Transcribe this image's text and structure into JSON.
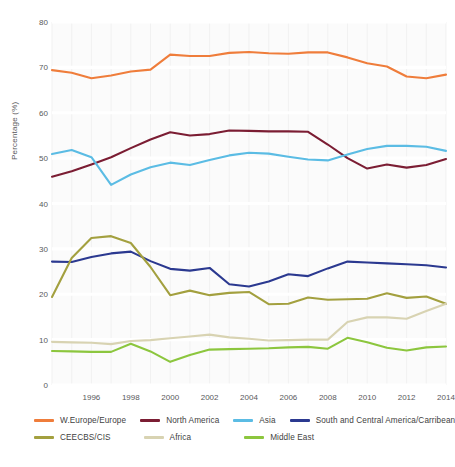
{
  "chart_data": {
    "type": "line",
    "title": "",
    "xlabel": "",
    "ylabel": "Percentage (%)",
    "ylim": [
      0,
      80
    ],
    "ytick_values": [
      0,
      10,
      20,
      30,
      40,
      50,
      60,
      70,
      80
    ],
    "xlim": [
      1994,
      2014
    ],
    "xtick_values": [
      1996,
      1998,
      2000,
      2002,
      2004,
      2006,
      2008,
      2010,
      2012,
      2014
    ],
    "x": [
      1994,
      1995,
      1996,
      1997,
      1998,
      1999,
      2000,
      2001,
      2002,
      2003,
      2004,
      2005,
      2006,
      2007,
      2008,
      2009,
      2010,
      2011,
      2012,
      2013,
      2014
    ],
    "grid": true,
    "legend_position": "bottom",
    "series": [
      {
        "name": "W.Europe/Europe",
        "color": "#ef7d3b",
        "values": [
          69.4,
          68.8,
          67.6,
          68.2,
          69.1,
          69.5,
          72.8,
          72.5,
          72.5,
          73.2,
          73.4,
          73.1,
          73.0,
          73.3,
          73.3,
          72.2,
          70.9,
          70.2,
          68.0,
          67.6,
          68.4
        ]
      },
      {
        "name": "North America",
        "color": "#7b1d33",
        "values": [
          45.9,
          47.1,
          48.6,
          50.2,
          52.2,
          54.1,
          55.7,
          55.0,
          55.3,
          56.1,
          56.0,
          55.9,
          55.9,
          55.8,
          53.0,
          50.0,
          47.7,
          48.6,
          47.9,
          48.5,
          49.8
        ]
      },
      {
        "name": "Asia",
        "color": "#5bbce4",
        "values": [
          50.9,
          51.8,
          50.2,
          44.1,
          46.4,
          48.0,
          49.0,
          48.5,
          49.6,
          50.6,
          51.2,
          51.0,
          50.3,
          49.7,
          49.5,
          50.8,
          52.0,
          52.7,
          52.7,
          52.5,
          51.6
        ]
      },
      {
        "name": "South and Central America/Carribean",
        "color": "#2b3990",
        "values": [
          27.2,
          27.1,
          28.2,
          29.0,
          29.4,
          27.3,
          25.6,
          25.2,
          25.8,
          22.2,
          21.7,
          22.8,
          24.4,
          24.0,
          25.7,
          27.2,
          27.0,
          26.8,
          26.6,
          26.4,
          25.9
        ]
      },
      {
        "name": "CEECBS/CIS",
        "color": "#a3a03f",
        "values": [
          19.4,
          28.0,
          32.4,
          32.8,
          31.3,
          26.0,
          19.8,
          20.8,
          19.8,
          20.3,
          20.5,
          17.8,
          17.9,
          19.3,
          18.8,
          18.9,
          19.0,
          20.2,
          19.2,
          19.5,
          17.9
        ]
      },
      {
        "name": "Africa",
        "color": "#d8d3b2",
        "values": [
          9.5,
          9.4,
          9.3,
          9.0,
          9.7,
          9.9,
          10.3,
          10.7,
          11.1,
          10.5,
          10.2,
          9.8,
          9.9,
          10.0,
          10.0,
          13.9,
          14.9,
          14.9,
          14.6,
          16.3,
          17.9
        ]
      },
      {
        "name": "Middle East",
        "color": "#8cc63e",
        "values": [
          7.5,
          7.4,
          7.3,
          7.3,
          9.1,
          7.4,
          5.1,
          6.6,
          7.8,
          7.9,
          8.0,
          8.1,
          8.3,
          8.4,
          8.0,
          10.4,
          9.4,
          8.2,
          7.6,
          8.3,
          8.5
        ]
      }
    ]
  },
  "axis": {
    "ylabel": "Percentage (%)",
    "yticks": [
      "0",
      "10",
      "20",
      "30",
      "40",
      "50",
      "60",
      "70",
      "80"
    ],
    "xticks": [
      "1996",
      "1998",
      "2000",
      "2002",
      "2004",
      "2006",
      "2008",
      "2010",
      "2012",
      "2014"
    ]
  },
  "legend": {
    "row1": [
      {
        "label": "W.Europe/Europe",
        "color": "#ef7d3b"
      },
      {
        "label": "North America",
        "color": "#7b1d33"
      },
      {
        "label": "Asia",
        "color": "#5bbce4"
      },
      {
        "label": "South and Central America/Carribean",
        "color": "#2b3990"
      }
    ],
    "row2": [
      {
        "label": "CEECBS/CIS",
        "color": "#a3a03f"
      },
      {
        "label": "Africa",
        "color": "#d8d3b2"
      },
      {
        "label": "Middle East",
        "color": "#8cc63e"
      }
    ]
  }
}
